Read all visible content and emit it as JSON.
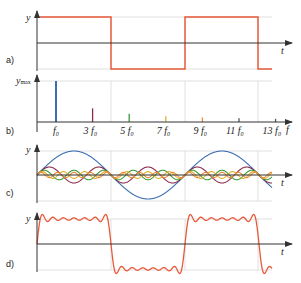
{
  "panels": {
    "a": {
      "label": "a)",
      "y_axis": "y",
      "x_axis": "t"
    },
    "b": {
      "label": "b)",
      "y_axis": "y",
      "y_axis_sub": "max",
      "x_axis": "f"
    },
    "c": {
      "label": "c)",
      "y_axis": "y",
      "x_axis": "t"
    },
    "d": {
      "label": "d)",
      "y_axis": "y",
      "x_axis": "t"
    }
  },
  "colors": {
    "square": "#e8593a",
    "axis": "#333333",
    "grid": "#d8d8d8",
    "harmonics": [
      "#3d6fb0",
      "#8a2a4a",
      "#3a9a3a",
      "#e3b030",
      "#f08a3a",
      "#555555",
      "#555555"
    ]
  },
  "chart_data": {
    "type": "line",
    "panels": [
      {
        "id": "a",
        "description": "Square wave signal y(t)",
        "xlabel": "t",
        "ylabel": "y"
      },
      {
        "id": "b",
        "description": "Amplitude spectrum (odd harmonics)",
        "type": "bar",
        "xlabel": "f",
        "ylabel": "y_max",
        "categories": [
          "f0",
          "3 f0",
          "5 f0",
          "7 f0",
          "9 f0",
          "11 f0",
          "13 f0"
        ],
        "values": [
          1.0,
          0.333,
          0.2,
          0.143,
          0.111,
          0.091,
          0.077
        ]
      },
      {
        "id": "c",
        "description": "Individual sine harmonics 1,3,5,7,9",
        "xlabel": "t",
        "ylabel": "y"
      },
      {
        "id": "d",
        "description": "Sum of harmonics approximating square wave",
        "xlabel": "t",
        "ylabel": "y"
      }
    ]
  },
  "spectrum_labels": [
    {
      "n": "",
      "sub": "0"
    },
    {
      "n": "3 ",
      "sub": "0"
    },
    {
      "n": "5 ",
      "sub": "0"
    },
    {
      "n": "7 ",
      "sub": "0"
    },
    {
      "n": "9 ",
      "sub": "0"
    },
    {
      "n": "11 ",
      "sub": "0"
    },
    {
      "n": "13 ",
      "sub": "0"
    }
  ]
}
